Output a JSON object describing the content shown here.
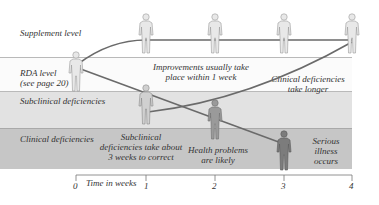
{
  "bands": {
    "supplement": "Supplement level",
    "rda_line1": "RDA level",
    "rda_line2": "(see page 20)",
    "subclinical": "Subclinical deficiencies",
    "clinical": "Clinical deficiencies"
  },
  "annotations": {
    "improvements_line1": "Improvements usually take",
    "improvements_line2": "place within 1 week",
    "clinical_longer_line1": "Clinical deficiencies",
    "clinical_longer_line2": "take longer",
    "subclinical_correct_line1": "Subclinical",
    "subclinical_correct_line2": "deficiencies take about",
    "subclinical_correct_line3": "3 weeks to correct",
    "health_line1": "Health problems",
    "health_line2": "are likely",
    "serious_line1": "Serious",
    "serious_line2": "illness",
    "serious_line3": "occurs"
  },
  "axis": {
    "title": "Time in weeks",
    "ticks": [
      "0",
      "1",
      "2",
      "3",
      "4"
    ]
  },
  "colors": {
    "band_subclinical": "#e2e2e2",
    "band_clinical": "#c6c6c6",
    "line": "#6a6a6a",
    "figure_light": "#d8d8d8",
    "figure_dark": "#8a8a8a"
  }
}
